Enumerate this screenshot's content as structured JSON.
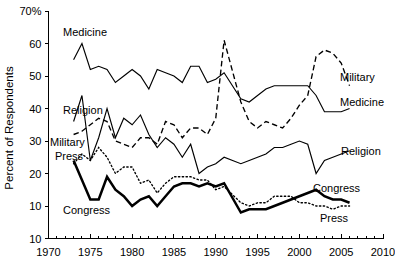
{
  "chart_data": {
    "type": "line",
    "title": "",
    "subtitle": "",
    "xlabel": "",
    "ylabel": "Percent of Respondents",
    "xlim": [
      1970,
      2010
    ],
    "ylim": [
      0,
      70
    ],
    "grid": false,
    "legend_position": "inline-right",
    "x_ticks": [
      1970,
      1975,
      1980,
      1985,
      1990,
      1995,
      2000,
      2005,
      2010
    ],
    "x_tick_labels": [
      "1970",
      "1975",
      "1980",
      "1985",
      "1990",
      "1995",
      "2000",
      "2005",
      "2010"
    ],
    "x_minor_tick_step": 1,
    "y_ticks": [
      0,
      10,
      20,
      30,
      40,
      50,
      60,
      70
    ],
    "y_tick_labels": [
      "10",
      "10",
      "20",
      "30",
      "40",
      "50",
      "60",
      "70%"
    ],
    "y_tick_note": "bottom-most tick is printed as 10 in the source figure though it marks the 0 baseline",
    "series": [
      {
        "name": "Medicine",
        "style": "solid-thin",
        "label_inline": "Medicine",
        "label_end": "Medicine",
        "x": [
          1973,
          1974,
          1975,
          1976,
          1977,
          1978,
          1979,
          1980,
          1981,
          1982,
          1983,
          1984,
          1985,
          1986,
          1987,
          1988,
          1989,
          1990,
          1991,
          1993,
          1994,
          1995,
          1996,
          1997,
          1998,
          1999,
          2000,
          2001,
          2002,
          2003,
          2004,
          2005,
          2006
        ],
        "values": [
          55,
          60,
          52,
          53,
          52,
          48,
          50,
          52,
          50,
          46,
          52,
          51,
          50,
          48,
          53,
          53,
          48,
          49,
          51,
          43,
          42,
          44,
          46,
          47,
          47,
          47,
          47,
          47,
          44,
          39,
          39,
          39,
          40
        ]
      },
      {
        "name": "Military",
        "style": "dashed",
        "label_inline": "Military",
        "label_end": "Military",
        "x": [
          1973,
          1974,
          1975,
          1976,
          1977,
          1978,
          1979,
          1980,
          1981,
          1982,
          1983,
          1984,
          1985,
          1986,
          1987,
          1988,
          1989,
          1990,
          1991,
          1993,
          1994,
          1995,
          1996,
          1997,
          1998,
          1999,
          2000,
          2001,
          2002,
          2003,
          2004,
          2005,
          2006
        ],
        "values": [
          32,
          33,
          35,
          37,
          36,
          30,
          29,
          28,
          31,
          31,
          29,
          36,
          35,
          31,
          34,
          34,
          32,
          37,
          61,
          42,
          36,
          34,
          36,
          35,
          34,
          37,
          41,
          44,
          56,
          58,
          57,
          54,
          47
        ]
      },
      {
        "name": "Religion",
        "style": "solid-thin",
        "label_inline": "Religion",
        "label_end": "Religion",
        "x": [
          1973,
          1974,
          1975,
          1976,
          1977,
          1978,
          1979,
          1980,
          1981,
          1982,
          1983,
          1984,
          1985,
          1986,
          1987,
          1988,
          1989,
          1990,
          1991,
          1993,
          1994,
          1995,
          1996,
          1997,
          1998,
          1999,
          2000,
          2001,
          2002,
          2003,
          2004,
          2005,
          2006
        ],
        "values": [
          36,
          44,
          24,
          31,
          40,
          31,
          37,
          35,
          38,
          32,
          28,
          31,
          29,
          25,
          29,
          20,
          22,
          23,
          25,
          23,
          24,
          25,
          26,
          28,
          28,
          29,
          30,
          29,
          20,
          24,
          25,
          26,
          27
        ]
      },
      {
        "name": "Press",
        "style": "dotted",
        "label_inline": "Press",
        "label_end": "Press",
        "x": [
          1973,
          1974,
          1975,
          1976,
          1977,
          1978,
          1979,
          1980,
          1981,
          1982,
          1983,
          1984,
          1985,
          1986,
          1987,
          1988,
          1989,
          1990,
          1991,
          1993,
          1994,
          1995,
          1996,
          1997,
          1998,
          1999,
          2000,
          2001,
          2002,
          2003,
          2004,
          2005,
          2006
        ],
        "values": [
          23,
          26,
          24,
          28,
          25,
          20,
          22,
          22,
          17,
          18,
          14,
          17,
          19,
          19,
          19,
          18,
          18,
          15,
          16,
          11,
          10,
          11,
          11,
          13,
          13,
          13,
          11,
          11,
          10,
          10,
          9,
          10,
          10
        ]
      },
      {
        "name": "Congress",
        "style": "solid-thick",
        "label_inline": "Congress",
        "label_end": "Congress",
        "x": [
          1973,
          1974,
          1975,
          1976,
          1977,
          1978,
          1979,
          1980,
          1981,
          1982,
          1983,
          1984,
          1985,
          1986,
          1987,
          1988,
          1989,
          1990,
          1991,
          1993,
          1994,
          1995,
          1996,
          1997,
          1998,
          1999,
          2000,
          2001,
          2002,
          2003,
          2004,
          2005,
          2006
        ],
        "values": [
          24,
          18,
          12,
          12,
          19,
          15,
          13,
          10,
          12,
          13,
          10,
          13,
          16,
          17,
          17,
          16,
          17,
          16,
          17,
          8,
          9,
          9,
          9,
          10,
          11,
          12,
          13,
          14,
          15,
          13,
          12,
          12,
          11
        ]
      }
    ],
    "inline_annotations": [
      {
        "text": "Medicine",
        "near_year": 1975,
        "near_value": 64
      },
      {
        "text": "Religion",
        "near_year": 1975,
        "near_value": 45
      },
      {
        "text": "Military",
        "near_year": 1973,
        "near_value": 31
      },
      {
        "text": "Press",
        "near_year": 1973,
        "near_value": 27
      },
      {
        "text": "Congress",
        "near_year": 1977,
        "near_value": 9
      }
    ],
    "end_annotations": [
      {
        "text": "Military",
        "series": "Military"
      },
      {
        "text": "Medicine",
        "series": "Medicine"
      },
      {
        "text": "Religion",
        "series": "Religion"
      },
      {
        "text": "Congress",
        "series": "Congress"
      },
      {
        "text": "Press",
        "series": "Press"
      }
    ]
  }
}
